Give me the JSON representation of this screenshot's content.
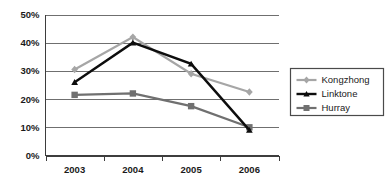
{
  "chart_data": {
    "type": "line",
    "title": "",
    "subtitle": "",
    "xlabel": "",
    "ylabel": "",
    "categories": [
      "2003",
      "2004",
      "2005",
      "2006"
    ],
    "x": [
      2003,
      2004,
      2005,
      2006
    ],
    "ylim": [
      0,
      50
    ],
    "ytick_labels": [
      "0%",
      "10%",
      "20%",
      "30%",
      "40%",
      "50%"
    ],
    "ytick_values": [
      0,
      10,
      20,
      30,
      40,
      50
    ],
    "grid": true,
    "legend_position": "right",
    "value_suffix": "%",
    "series": [
      {
        "name": "Kongzhong",
        "values": [
          30.5,
          42.0,
          29.0,
          22.5
        ],
        "color": "#a6a6a6",
        "marker": "diamond",
        "line_width": 2.2
      },
      {
        "name": "Linktone",
        "values": [
          26.0,
          40.0,
          32.5,
          9.0
        ],
        "color": "#0d0d0d",
        "marker": "triangle",
        "line_width": 2.4
      },
      {
        "name": "Hurray",
        "values": [
          21.5,
          22.0,
          17.5,
          10.0
        ],
        "color": "#707070",
        "marker": "square",
        "line_width": 2.2
      }
    ]
  },
  "legend": {
    "entries": [
      {
        "label": "Kongzhong"
      },
      {
        "label": "Linktone"
      },
      {
        "label": "Hurray"
      }
    ]
  },
  "axes": {
    "y_labels": [
      "50%",
      "40%",
      "30%",
      "20%",
      "10%",
      "0%"
    ],
    "x_labels": [
      "2003",
      "2004",
      "2005",
      "2006"
    ]
  }
}
